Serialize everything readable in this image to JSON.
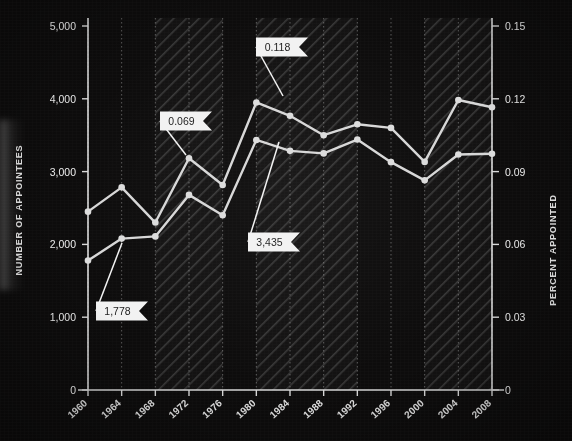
{
  "chart_data": {
    "type": "line",
    "title": "",
    "xlabel": "",
    "ylabel": "NUMBER OF APPOINTEES",
    "y2label": "PERCENT APPOINTED",
    "x": [
      1960,
      1964,
      1968,
      1972,
      1976,
      1980,
      1984,
      1988,
      1992,
      1996,
      2000,
      2004,
      2008
    ],
    "xtick_labels": [
      "1960",
      "1964",
      "1968",
      "1972",
      "1976",
      "1980",
      "1984",
      "1988",
      "1992",
      "1996",
      "2000",
      "2004",
      "2008"
    ],
    "ylim": [
      0,
      5000
    ],
    "ytick_values": [
      0,
      1000,
      2000,
      3000,
      4000,
      5000
    ],
    "ytick_labels": [
      "0",
      "1,000",
      "2,000",
      "3,000",
      "4,000",
      "5,000"
    ],
    "y2lim": [
      0,
      0.15
    ],
    "y2tick_values": [
      0,
      0.03,
      0.06,
      0.09,
      0.12,
      0.15
    ],
    "y2tick_labels": [
      "0",
      "0.03",
      "0.06",
      "0.09",
      "0.12",
      "0.15"
    ],
    "grid": true,
    "legend": "none",
    "series": [
      {
        "name": "NUMBER OF APPOINTEES",
        "axis": "left",
        "color": "#d7d7d7",
        "values": [
          1778,
          2080,
          2110,
          2680,
          2400,
          3435,
          3285,
          3250,
          3440,
          3130,
          2880,
          3235,
          3245
        ]
      },
      {
        "name": "PERCENT APPOINTED",
        "axis": "right",
        "color": "#d7d7d7",
        "values": [
          0.0735,
          0.0835,
          0.069,
          0.0955,
          0.0845,
          0.1185,
          0.113,
          0.105,
          0.1095,
          0.108,
          0.094,
          0.1195,
          0.1165
        ]
      }
    ],
    "annotations": [
      {
        "label": "0.118",
        "series": "PERCENT APPOINTED",
        "x": 1980,
        "align": "left"
      },
      {
        "label": "0.069",
        "series": "PERCENT APPOINTED",
        "x": 1968,
        "align": "left"
      },
      {
        "label": "3,435",
        "series": "NUMBER OF APPOINTEES",
        "x": 1980,
        "align": "left"
      },
      {
        "label": "1,778",
        "series": "NUMBER OF APPOINTEES",
        "x": 1960,
        "align": "left"
      }
    ],
    "shaded_bands": [
      {
        "from": 1968,
        "to": 1976,
        "style": "hatched"
      },
      {
        "from": 1980,
        "to": 1992,
        "style": "hatched"
      },
      {
        "from": 2000,
        "to": 2008,
        "style": "hatched"
      }
    ],
    "background_color": "#0d0c0c",
    "line_color": "#d7d7d7",
    "marker_color": "#dcdcdc",
    "callout_bg": "#f2f2f2",
    "axis_color": "#d9d9d9"
  }
}
